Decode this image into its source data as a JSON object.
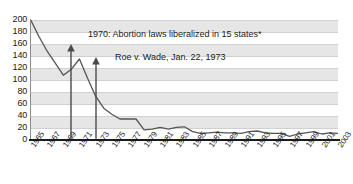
{
  "chart_data": {
    "type": "line",
    "title": "",
    "xlabel": "",
    "ylabel": "",
    "ylim": [
      0,
      200
    ],
    "xlim": [
      1965,
      2003
    ],
    "grid": true,
    "legend": "none",
    "x": [
      1965,
      1966,
      1967,
      1968,
      1969,
      1970,
      1971,
      1972,
      1973,
      1974,
      1975,
      1976,
      1977,
      1978,
      1979,
      1980,
      1981,
      1982,
      1983,
      1984,
      1985,
      1986,
      1987,
      1988,
      1989,
      1990,
      1991,
      1992,
      1993,
      1994,
      1995,
      1996,
      1997,
      1998,
      1999,
      2000,
      2001,
      2002,
      2003
    ],
    "values": [
      199,
      172,
      148,
      128,
      108,
      118,
      135,
      103,
      73,
      53,
      43,
      35,
      35,
      35,
      17,
      18,
      21,
      18,
      21,
      22,
      14,
      11,
      12,
      13,
      12,
      12,
      11,
      14,
      15,
      12,
      11,
      11,
      6,
      10,
      12,
      14,
      10,
      12,
      11
    ],
    "series": [
      {
        "name": "rate",
        "values": [
          199,
          172,
          148,
          128,
          108,
          118,
          135,
          103,
          73,
          53,
          43,
          35,
          35,
          35,
          17,
          18,
          21,
          18,
          21,
          22,
          14,
          11,
          12,
          13,
          12,
          12,
          11,
          14,
          15,
          12,
          11,
          11,
          6,
          10,
          12,
          14,
          10,
          12,
          11
        ]
      }
    ],
    "y_ticks": [
      0,
      20,
      40,
      60,
      80,
      100,
      120,
      140,
      160,
      180,
      200
    ],
    "x_ticks": [
      1965,
      1967,
      1969,
      1971,
      1973,
      1975,
      1977,
      1979,
      1981,
      1983,
      1985,
      1987,
      1989,
      1991,
      1993,
      1995,
      1997,
      1999,
      2001,
      2003
    ],
    "annotations": [
      {
        "id": "annotation-1",
        "text": "1970: Abortion laws liberalized in 15 states*",
        "arrow_at_x": 1970,
        "arrow_top_value": 160
      },
      {
        "id": "annotation-2",
        "text": "Roe v. Wade, Jan. 22, 1973",
        "arrow_at_x": 1973,
        "arrow_top_value": 138
      }
    ],
    "colors": {
      "line": "#555555",
      "band": "#e6e6e6",
      "gridline": "#d0d0d0",
      "axis": "#1a1a1a",
      "arrow": "#4a4a4a",
      "text": "#1a1a1a"
    }
  },
  "y_axis": {
    "labels": [
      "200",
      "180",
      "160",
      "140",
      "120",
      "100",
      "80",
      "60",
      "40",
      "20",
      "0"
    ]
  },
  "x_axis": {
    "labels": [
      "1965",
      "1967",
      "1969",
      "1971",
      "1973",
      "1975",
      "1977",
      "1979",
      "1981",
      "1983",
      "1985",
      "1987",
      "1989",
      "1991",
      "1993",
      "1995",
      "1997",
      "1999",
      "2001",
      "2003"
    ]
  },
  "annotations": {
    "first": "1970: Abortion laws liberalized in 15 states*",
    "second": "Roe v. Wade, Jan. 22, 1973"
  }
}
